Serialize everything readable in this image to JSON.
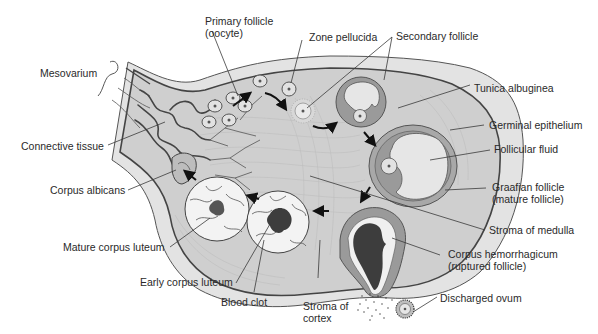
{
  "diagram": {
    "colors": {
      "background": "#ffffff",
      "tunica_outer": "#e3e3e3",
      "cortex": "#cfcfcf",
      "follicle_wall": "#9a9a9a",
      "follicular_fluid": "#e6e6e6",
      "blood_clot": "#3d3d3d",
      "label_text": "#2a2a2a"
    },
    "labels": {
      "primary_follicle_line1": "Primary follicle",
      "primary_follicle_line2": "(oocyte)",
      "zone_pellucida": "Zone pellucida",
      "secondary_follicle": "Secondary follicle",
      "mesovarium": "Mesovarium",
      "tunica_albuginea": "Tunica albuginea",
      "germinal_epithelium": "Germinal epithelium",
      "connective_tissue": "Connective tissue",
      "follicular_fluid": "Follicular fluid",
      "corpus_albicans": "Corpus albicans",
      "graafian_follicle_line1": "Graafian follicle",
      "graafian_follicle_line2": "(mature follicle)",
      "stroma_of_medulla": "Stroma of medulla",
      "mature_corpus_luteum": "Mature corpus luteum",
      "corpus_hemorrhagicum_line1": "Corpus hemorrhagicum",
      "corpus_hemorrhagicum_line2": "(ruptured follicle)",
      "early_corpus_luteum": "Early corpus luteum",
      "blood_clot": "Blood clot",
      "discharged_ovum": "Discharged ovum",
      "stroma_of_cortex_line1": "Stroma of",
      "stroma_of_cortex_line2": "cortex"
    }
  }
}
